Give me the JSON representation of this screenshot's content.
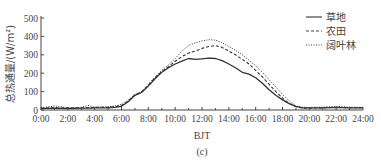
{
  "chart_data": {
    "type": "line",
    "title": "",
    "panel_label": "(c)",
    "xlabel": "BJT",
    "ylabel": "总热通量/(W/m²)",
    "ylim": [
      0,
      500
    ],
    "xlim": [
      0,
      24
    ],
    "yticks": [
      0,
      100,
      200,
      300,
      400,
      500
    ],
    "xticks": [
      "0:00",
      "2:00",
      "4:00",
      "6:00",
      "8:00",
      "10:00",
      "12:00",
      "14:00",
      "16:00",
      "18:00",
      "20:00",
      "22:00",
      "24:00"
    ],
    "grid": false,
    "legend_position": "upper right",
    "x": [
      0,
      1,
      2,
      3,
      3.5,
      4,
      5,
      5.5,
      6,
      6.5,
      7,
      7.5,
      8,
      8.5,
      9,
      9.5,
      10,
      10.5,
      11,
      11.5,
      12,
      12.5,
      13,
      13.5,
      14,
      14.5,
      15,
      15.5,
      16,
      16.5,
      17,
      17.5,
      18,
      18.5,
      19,
      19.5,
      20,
      21,
      22,
      23,
      24
    ],
    "series": [
      {
        "name": "草地",
        "style": "solid",
        "values": [
          8,
          10,
          8,
          10,
          10,
          12,
          12,
          14,
          20,
          45,
          80,
          95,
          130,
          170,
          205,
          230,
          250,
          265,
          280,
          275,
          278,
          282,
          280,
          268,
          250,
          230,
          205,
          195,
          175,
          145,
          110,
          80,
          55,
          35,
          20,
          12,
          12,
          12,
          14,
          12,
          12
        ]
      },
      {
        "name": "农田",
        "style": "dashed",
        "values": [
          10,
          12,
          10,
          12,
          12,
          14,
          15,
          18,
          25,
          48,
          82,
          98,
          135,
          175,
          210,
          235,
          265,
          290,
          310,
          320,
          335,
          345,
          350,
          340,
          320,
          300,
          275,
          250,
          215,
          180,
          140,
          100,
          65,
          35,
          18,
          10,
          10,
          12,
          14,
          12,
          12
        ]
      },
      {
        "name": "阔叶林",
        "style": "dotted",
        "values": [
          12,
          22,
          12,
          14,
          25,
          15,
          18,
          22,
          30,
          55,
          85,
          100,
          140,
          180,
          215,
          245,
          280,
          320,
          350,
          365,
          375,
          382,
          380,
          365,
          345,
          325,
          300,
          270,
          240,
          205,
          165,
          125,
          85,
          50,
          22,
          15,
          14,
          16,
          20,
          16,
          14
        ]
      }
    ]
  },
  "legend": {
    "items": [
      {
        "label": "草地",
        "style": "solid"
      },
      {
        "label": "农田",
        "style": "dashed"
      },
      {
        "label": "阔叶林",
        "style": "dotted"
      }
    ]
  }
}
